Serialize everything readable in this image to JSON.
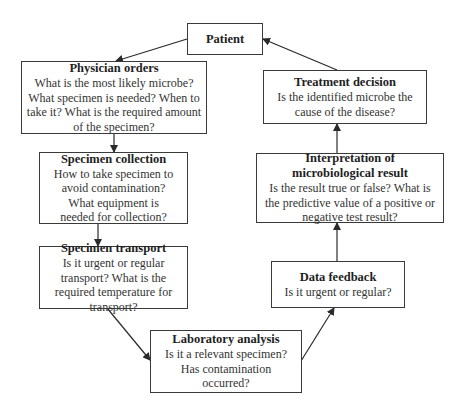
{
  "diagram": {
    "type": "flowchart-cycle",
    "line_color": "#2a2a2a",
    "nodes": [
      {
        "id": "patient",
        "title": "Patient",
        "desc": ""
      },
      {
        "id": "physician_orders",
        "title": "Physician orders",
        "desc": "What is the most likely microbe? What specimen is needed? When to take it? What is the required amount of the specimen?"
      },
      {
        "id": "specimen_collection",
        "title": "Specimen collection",
        "desc": "How to take specimen to avoid contamination? What equipment is needed for collection?"
      },
      {
        "id": "specimen_transport",
        "title": "Specimen transport",
        "desc": "Is it urgent or regular transport? What is the required temperature for transport?"
      },
      {
        "id": "laboratory_analysis",
        "title": "Laboratory analysis",
        "desc": "Is it a relevant specimen? Has contamination occurred?"
      },
      {
        "id": "data_feedback",
        "title": "Data feedback",
        "desc": "Is it urgent or regular?"
      },
      {
        "id": "interpretation",
        "title": "Interpretation of microbiological result",
        "desc": "Is the result true or false? What is the predictive value of a positive or negative test result?"
      },
      {
        "id": "treatment_decision",
        "title": "Treatment decision",
        "desc": "Is the identified microbe the cause of the disease?"
      }
    ],
    "edges": [
      {
        "from": "patient",
        "to": "physician_orders"
      },
      {
        "from": "physician_orders",
        "to": "specimen_collection"
      },
      {
        "from": "specimen_collection",
        "to": "specimen_transport"
      },
      {
        "from": "specimen_transport",
        "to": "laboratory_analysis"
      },
      {
        "from": "laboratory_analysis",
        "to": "data_feedback"
      },
      {
        "from": "data_feedback",
        "to": "interpretation"
      },
      {
        "from": "interpretation",
        "to": "treatment_decision"
      },
      {
        "from": "treatment_decision",
        "to": "patient"
      }
    ]
  }
}
